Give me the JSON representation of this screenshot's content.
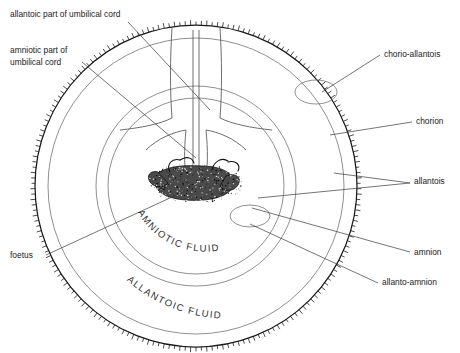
{
  "figure": {
    "background_color": "#ffffff",
    "ink_color": "#1a1a1a",
    "membrane_color": "#6b6b6b",
    "leader_color": "#3a3a3a"
  },
  "labels_left": [
    {
      "id": "allantoic-part-of-umbilical-cord",
      "lines": [
        "allantoic part of umbilical cord"
      ],
      "x": 10,
      "y": 17
    },
    {
      "id": "amniotic-part-of-umbilical-cord",
      "lines": [
        "amniotic part of",
        "umbilical cord"
      ],
      "x": 10,
      "y": 53
    },
    {
      "id": "foetus",
      "lines": [
        "foetus"
      ],
      "x": 10,
      "y": 258
    }
  ],
  "labels_right": [
    {
      "id": "chorio-allantois",
      "lines": [
        "chorio-allantois"
      ],
      "x": 384,
      "y": 57
    },
    {
      "id": "chorion",
      "lines": [
        "chorion"
      ],
      "x": 416,
      "y": 124
    },
    {
      "id": "allantois",
      "lines": [
        "allantois"
      ],
      "x": 414,
      "y": 184
    },
    {
      "id": "amnion",
      "lines": [
        "amnion"
      ],
      "x": 414,
      "y": 255
    },
    {
      "id": "allanto-amnion",
      "lines": [
        "allanto-amnion"
      ],
      "x": 382,
      "y": 285
    }
  ],
  "fluid_labels": [
    {
      "id": "amniotic-fluid",
      "text": "AMNIOTIC FLUID",
      "path_id": "amnioticArc"
    },
    {
      "id": "allantoic-fluid",
      "text": "ALLANTOIC FLUID",
      "path_id": "allantoicArc"
    }
  ],
  "structures": [
    {
      "id": "chorion-outer-wall",
      "type": "circle",
      "cx": 196,
      "cy": 186,
      "r": 161
    },
    {
      "id": "allanto-amnion-wall",
      "type": "circle",
      "cx": 196,
      "cy": 186,
      "r": 148
    },
    {
      "id": "amnion-wall",
      "type": "circle",
      "cx": 196,
      "cy": 186,
      "r": 100
    },
    {
      "id": "amniotic-inner-wall",
      "type": "circle",
      "cx": 196,
      "cy": 186,
      "r": 88
    },
    {
      "id": "chorio-allantois-vesicle",
      "type": "ellipse",
      "cx": 316,
      "cy": 92,
      "rx": 21,
      "ry": 12
    },
    {
      "id": "allanto-amnion-vesicle",
      "type": "ellipse",
      "cx": 250,
      "cy": 216,
      "rx": 20,
      "ry": 11
    },
    {
      "id": "umbilical-cord-stalk",
      "type": "vertical-cord",
      "x": 196,
      "top": 25,
      "bottom": 186
    },
    {
      "id": "foetus-embryo",
      "type": "stippled-mass",
      "cx": 196,
      "cy": 180
    }
  ]
}
